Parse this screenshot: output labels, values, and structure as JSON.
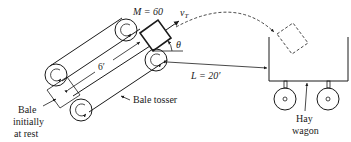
{
  "figure": {
    "type": "physics-diagram"
  },
  "labels": {
    "mass": "M = 60",
    "velocity_symbol": "v",
    "velocity_subscript": "T",
    "angle": "θ",
    "belt_length": "6′",
    "horizontal_distance": "L = 20′",
    "bale_tosser": "Bale tosser",
    "bale_initial_line1": "Bale",
    "bale_initial_line2": "initially",
    "bale_initial_line3": "at rest",
    "hay_wagon_line1": "Hay",
    "hay_wagon_line2": "wagon"
  },
  "components": {
    "upper_belt": {
      "rollers": 2,
      "rotation": "counterclockwise"
    },
    "lower_belt": {
      "rollers": 2,
      "rotation": "counterclockwise"
    },
    "bale_launch": {
      "style": "solid"
    },
    "bale_start": {
      "style": "thin-outline"
    },
    "bale_landing": {
      "style": "dashed"
    },
    "trajectory": {
      "style": "dashed-arc"
    },
    "wagon": {
      "wheels": 2
    }
  }
}
